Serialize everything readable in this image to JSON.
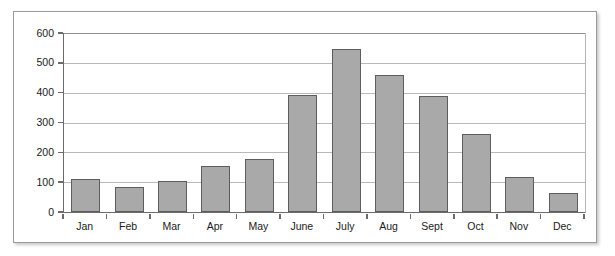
{
  "chart_data": {
    "type": "bar",
    "title": "",
    "subtitle": "",
    "xlabel": "",
    "ylabel": "",
    "categories": [
      "Jan",
      "Feb",
      "Mar",
      "Apr",
      "May",
      "June",
      "July",
      "Aug",
      "Sept",
      "Oct",
      "Nov",
      "Dec"
    ],
    "values": [
      110,
      85,
      103,
      155,
      178,
      393,
      545,
      460,
      390,
      262,
      118,
      63
    ],
    "ylim": [
      0,
      600
    ],
    "ytick_labels": [
      "0",
      "100",
      "200",
      "300",
      "400",
      "500",
      "600"
    ],
    "ytick_values": [
      0,
      100,
      200,
      300,
      400,
      500,
      600
    ],
    "grid": "horizontal",
    "legend": "none",
    "bar_fill_color": "#a9a9a9",
    "bar_border_color": "#5d5d5d",
    "gridline_color": "#b9b9b9",
    "axis_color": "#6b6b6b",
    "frame_border_color": "#9a9a9a",
    "background_color": "#ffffff"
  }
}
